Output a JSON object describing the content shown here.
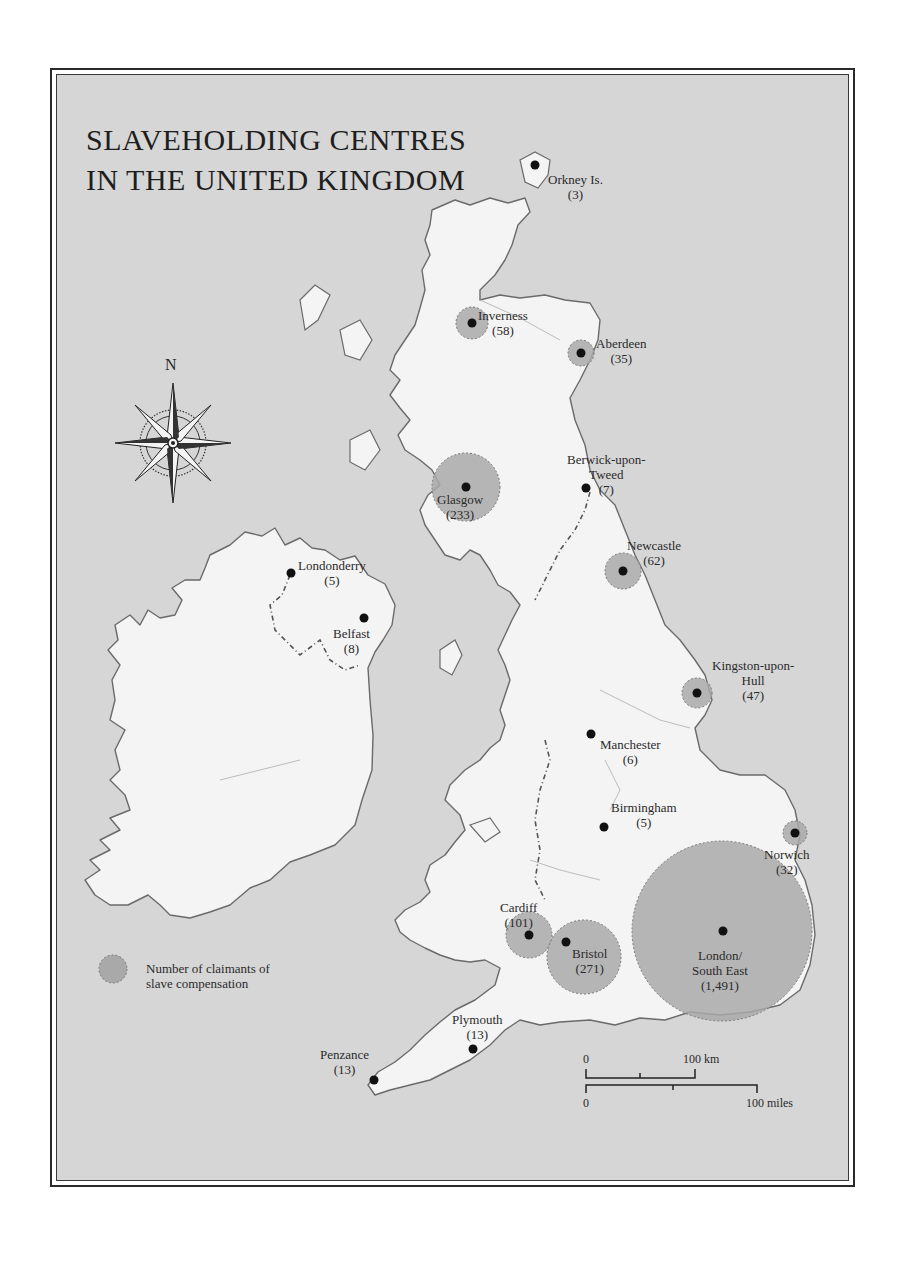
{
  "map": {
    "title_line1": "SLAVEHOLDING CENTRES",
    "title_line2": "IN THE UNITED KINGDOM",
    "compass": {
      "label": "N",
      "icon": "compass-rose-icon"
    },
    "legend": {
      "line1": "Number of claimants of",
      "line2": "slave compensation",
      "symbol": "proportional-circle"
    },
    "scale": {
      "km_start": "0",
      "km_end": "100 km",
      "miles_start": "0",
      "miles_end": "100 miles"
    },
    "colors": {
      "sea": "#d6d6d6",
      "land": "#f4f4f4",
      "circle_fill": "#a9a9a9",
      "coast": "#6a6a6a",
      "dot": "#111111"
    },
    "centres": [
      {
        "name": "Orkney Is.",
        "count": "(3)"
      },
      {
        "name": "Inverness",
        "count": "(58)"
      },
      {
        "name": "Aberdeen",
        "count": "(35)"
      },
      {
        "name": "Glasgow",
        "count": "(233)"
      },
      {
        "name_line1": "Berwick-upon-",
        "name_line2": "Tweed",
        "count": "(7)"
      },
      {
        "name": "Newcastle",
        "count": "(62)"
      },
      {
        "name": "Londonderry",
        "count": "(5)"
      },
      {
        "name": "Belfast",
        "count": "(8)"
      },
      {
        "name_line1": "Kingston-upon-",
        "name_line2": "Hull",
        "count": "(47)"
      },
      {
        "name": "Manchester",
        "count": "(6)"
      },
      {
        "name": "Birmingham",
        "count": "(5)"
      },
      {
        "name": "Norwich",
        "count": "(32)"
      },
      {
        "name": "Cardiff",
        "count": "(101)"
      },
      {
        "name": "Bristol",
        "count": "(271)"
      },
      {
        "name_line1": "London/",
        "name_line2": "South East",
        "count": "(1,491)"
      },
      {
        "name": "Plymouth",
        "count": "(13)"
      },
      {
        "name": "Penzance",
        "count": "(13)"
      }
    ]
  }
}
